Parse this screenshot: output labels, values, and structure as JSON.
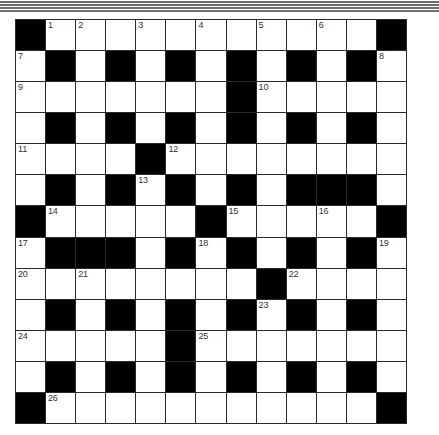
{
  "header": {
    "rule_offsets_px": [
      1,
      4,
      7,
      10
    ],
    "rule_color": "#6e6e6e"
  },
  "crossword": {
    "rows": 13,
    "cols": 13,
    "colors": {
      "block": "#000000",
      "cell": "#ffffff",
      "gridline": "#2a2a2a",
      "number": "#333333"
    },
    "layout": [
      "#..........#",
      "..#.#.#.#.#.",
      ".......#.....",
      ".#.#.#.#.#.#.",
      "....#........",
      ".#.#.#.#.###.",
      "#.....#.....#",
      ".###.#.#.#.#.",
      "........#....",
      ".#.#.#.#.#.#.",
      ".....#.......",
      ".#.#.#.#.#.#.",
      "#...........#"
    ],
    "grid": [
      [
        "#",
        "1",
        "2",
        "",
        "3",
        "",
        "4",
        "",
        "5",
        "",
        "6",
        "",
        "#"
      ],
      [
        "7",
        "#",
        "",
        "#",
        "",
        "#",
        "",
        "#",
        "",
        "#",
        "",
        "#",
        "8"
      ],
      [
        "9",
        "",
        "",
        "",
        "",
        "",
        "",
        "#",
        "10",
        "",
        "",
        "",
        ""
      ],
      [
        "",
        "#",
        "",
        "#",
        "",
        "#",
        "",
        "#",
        "",
        "#",
        "",
        "#",
        ""
      ],
      [
        "11",
        "",
        "",
        "",
        "#",
        "12",
        "",
        "",
        "",
        "",
        "",
        "",
        ""
      ],
      [
        "",
        "#",
        "",
        "#",
        "13",
        "#",
        "",
        "#",
        "",
        "#",
        "#",
        "#",
        ""
      ],
      [
        "#",
        "14",
        "",
        "",
        "",
        "",
        "#",
        "15",
        "",
        "",
        "16",
        "",
        "#"
      ],
      [
        "17",
        "#",
        "#",
        "#",
        "",
        "#",
        "18",
        "#",
        "",
        "#",
        "",
        "#",
        "19"
      ],
      [
        "20",
        "",
        "21",
        "",
        "",
        "",
        "",
        "",
        "#",
        "22",
        "",
        "",
        ""
      ],
      [
        "",
        "#",
        "",
        "#",
        "",
        "#",
        "",
        "#",
        "23",
        "#",
        "",
        "#",
        ""
      ],
      [
        "24",
        "",
        "",
        "",
        "",
        "#",
        "25",
        "",
        "",
        "",
        "",
        "",
        ""
      ],
      [
        "",
        "#",
        "",
        "#",
        "",
        "#",
        "",
        "#",
        "",
        "#",
        "",
        "#",
        ""
      ],
      [
        "#",
        "26",
        "",
        "",
        "",
        "",
        "",
        "",
        "",
        "",
        "",
        "",
        "#"
      ]
    ]
  }
}
